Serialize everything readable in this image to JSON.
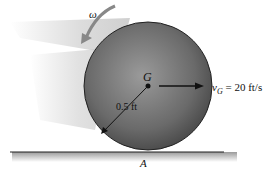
{
  "diagram": {
    "type": "rolling-disk",
    "labels": {
      "omega": "ω",
      "center": "G",
      "velocity": "v",
      "velocity_sub": "G",
      "velocity_value": " = 20 ft/s",
      "radius": "0.5 ft",
      "contact": "A"
    },
    "colors": {
      "disk": "#6e6e6e",
      "ground": "#222222",
      "shadow": "#c8c8c8"
    }
  }
}
